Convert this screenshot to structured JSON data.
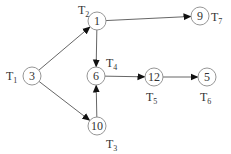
{
  "diagram": {
    "type": "directed-graph",
    "nodes": [
      {
        "id": "n3",
        "value": "3",
        "cx": 32,
        "cy": 76,
        "label": "T",
        "sub": "1",
        "lx": 6,
        "ly": 80
      },
      {
        "id": "n1",
        "value": "1",
        "cx": 97,
        "cy": 21,
        "label": "T",
        "sub": "2",
        "lx": 78,
        "ly": 14
      },
      {
        "id": "n6",
        "value": "6",
        "cx": 96,
        "cy": 76,
        "label": "T",
        "sub": "4",
        "lx": 106,
        "ly": 67
      },
      {
        "id": "n10",
        "value": "10",
        "cx": 97,
        "cy": 126,
        "label": "T",
        "sub": "3",
        "lx": 106,
        "ly": 148
      },
      {
        "id": "n9",
        "value": "9",
        "cx": 200,
        "cy": 16,
        "label": "T",
        "sub": "7",
        "lx": 211,
        "ly": 21
      },
      {
        "id": "n12",
        "value": "12",
        "cx": 154,
        "cy": 77,
        "label": "T",
        "sub": "5",
        "lx": 146,
        "ly": 101
      },
      {
        "id": "n5",
        "value": "5",
        "cx": 207,
        "cy": 77,
        "label": "T",
        "sub": "6",
        "lx": 200,
        "ly": 101
      }
    ],
    "edges": [
      {
        "from": "3",
        "to": "1"
      },
      {
        "from": "3",
        "to": "10"
      },
      {
        "from": "1",
        "to": "9"
      },
      {
        "from": "1",
        "to": "6"
      },
      {
        "from": "10",
        "to": "6"
      },
      {
        "from": "6",
        "to": "12"
      },
      {
        "from": "12",
        "to": "5"
      }
    ]
  }
}
